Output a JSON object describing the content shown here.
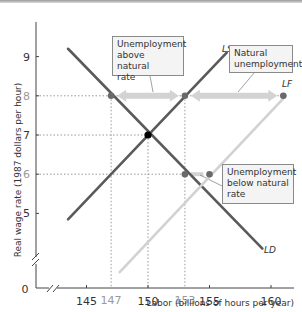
{
  "chart_data": {
    "type": "line",
    "title": "",
    "xlabel": "Labor (billions of hours per year)",
    "ylabel": "Real wage rate (1987 dollars per hour)",
    "xlim": [
      141,
      161
    ],
    "ylim": [
      4,
      9.8
    ],
    "origin_label": "0",
    "x_ticks": [
      "145",
      "150",
      "155",
      "160"
    ],
    "x_ticks_values": [
      145,
      150,
      155,
      160
    ],
    "x_highlight_ticks": [
      "147",
      "153"
    ],
    "x_highlight_values": [
      147,
      153
    ],
    "y_ticks": [
      "5",
      "6",
      "7",
      "8",
      "9"
    ],
    "y_ticks_values": [
      5,
      6,
      7,
      8,
      9
    ],
    "axis_breaks": true,
    "grid": false,
    "series": [
      {
        "name": "LD",
        "label": "LD",
        "color": "#5a5a5a",
        "x": [
          143.5,
          159.3
        ],
        "y": [
          9.2,
          4.1
        ]
      },
      {
        "name": "LS",
        "label": "LS",
        "color": "#5a5a5a",
        "x": [
          143.5,
          156.4
        ],
        "y": [
          4.85,
          9.1
        ]
      },
      {
        "name": "LF",
        "label": "LF",
        "color": "#d2d2d2",
        "x": [
          147.7,
          161.2
        ],
        "y": [
          3.5,
          8.0
        ]
      }
    ],
    "points": [
      {
        "name": "equilibrium",
        "x": 150,
        "y": 7,
        "color": "#000000"
      },
      {
        "name": "ld-at-8",
        "x": 147,
        "y": 8,
        "color": "#6a6a6a"
      },
      {
        "name": "ls-at-8",
        "x": 153,
        "y": 8,
        "color": "#6a6a6a"
      },
      {
        "name": "lf-at-8",
        "x": 161,
        "y": 8,
        "color": "#6a6a6a"
      },
      {
        "name": "ld-at-6",
        "x": 153,
        "y": 6,
        "color": "#6a6a6a"
      },
      {
        "name": "lf-at-6",
        "x": 155,
        "y": 6,
        "color": "#6a6a6a"
      }
    ],
    "reference_lines": [
      {
        "y": 8,
        "x_end": 161
      },
      {
        "y": 7,
        "x_end": 150
      },
      {
        "y": 6,
        "x_end": 153
      },
      {
        "x": 147,
        "y_end": 8
      },
      {
        "x": 150,
        "y_end": 7
      },
      {
        "x": 153,
        "y_end": 8
      }
    ],
    "arrows": [
      {
        "name": "unemployment-above-natural",
        "y": 8,
        "x_from": 147,
        "x_to": 153
      },
      {
        "name": "natural-unemployment",
        "y": 8,
        "x_from": 153,
        "x_to": 161
      },
      {
        "name": "unemployment-below-natural",
        "y": 6,
        "x_from": 153,
        "x_to": 155
      }
    ],
    "annotations": [
      {
        "name": "above",
        "lines": [
          "Unemployment",
          "above natural",
          "rate"
        ]
      },
      {
        "name": "natural",
        "lines": [
          "Natural",
          "unemployment"
        ]
      },
      {
        "name": "below",
        "lines": [
          "Unemployment",
          "below natural",
          "rate"
        ]
      }
    ]
  }
}
